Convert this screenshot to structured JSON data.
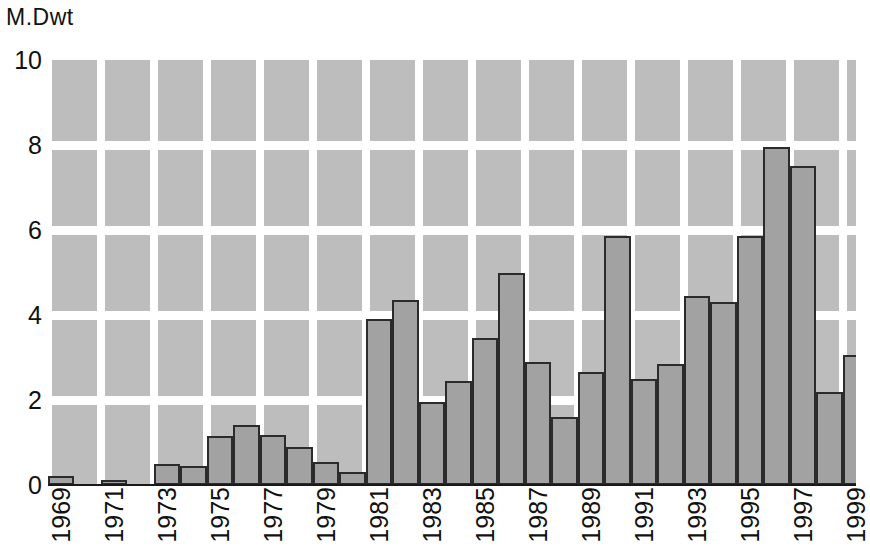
{
  "chart_data": {
    "type": "bar",
    "title": "",
    "ylabel": "M.Dwt",
    "xlabel": "",
    "ylim": [
      0,
      10
    ],
    "y_ticks": [
      "0",
      "2",
      "4",
      "6",
      "8",
      "10"
    ],
    "y_tick_values": [
      0,
      2,
      4,
      6,
      8,
      10
    ],
    "grid": true,
    "legend": "none",
    "bar_color": "#a2a2a2",
    "bar_edge_color": "#2b2b2b",
    "plot_background_color": "#bdbdbd",
    "gridline_color": "#ffffff",
    "x_tick_labels": [
      "1969",
      "1971",
      "1973",
      "1975",
      "1977",
      "1979",
      "1981",
      "1983",
      "1985",
      "1987",
      "1989",
      "1991",
      "1993",
      "1995",
      "1997",
      "1999"
    ],
    "categories": [
      "1969",
      "1970",
      "1971",
      "1972",
      "1973",
      "1974",
      "1975",
      "1976",
      "1977",
      "1978",
      "1979",
      "1980",
      "1981",
      "1982",
      "1983",
      "1984",
      "1985",
      "1986",
      "1987",
      "1988",
      "1989",
      "1990",
      "1991",
      "1992",
      "1993",
      "1994",
      "1995",
      "1996",
      "1997",
      "1998",
      "1999"
    ],
    "values": [
      0.22,
      0,
      0.12,
      0,
      0.5,
      0.45,
      1.15,
      1.42,
      1.18,
      0.9,
      0.55,
      0.3,
      3.9,
      4.35,
      1.95,
      2.45,
      3.45,
      5.0,
      2.9,
      1.6,
      2.65,
      5.85,
      2.5,
      2.85,
      4.45,
      4.3,
      5.85,
      7.95,
      7.5,
      2.2,
      3.05
    ]
  }
}
